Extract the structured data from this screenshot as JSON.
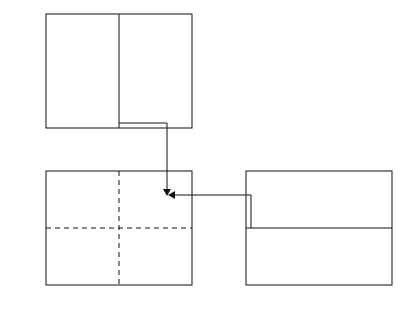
{
  "chart_data": [
    {
      "type": "line",
      "panel": "top-left",
      "title": "",
      "xlabel": "x(t)ωn/Vo",
      "ylabel": "ωnt",
      "xlim": [
        -1,
        1
      ],
      "ylim": [
        0,
        20
      ],
      "xticks": [
        "-1",
        "-0.5",
        "0",
        "0.5",
        "1"
      ],
      "yticks": [
        "0",
        "5",
        "10",
        "15",
        "20"
      ],
      "annotation": "t1",
      "t1": 0.8,
      "series": [
        {
          "name": "x(t) vs ωnt",
          "model": "damped free vibration, zeta=0.1",
          "points": [
            [
              0,
              0
            ],
            [
              0.5,
              1
            ],
            [
              0.76,
              2
            ],
            [
              0.86,
              1.5
            ],
            [
              0.39,
              2.8
            ],
            [
              0,
              3.16
            ],
            [
              -0.46,
              4
            ],
            [
              -0.6,
              4.62
            ],
            [
              -0.33,
              5.5
            ],
            [
              0,
              6.3
            ],
            [
              0.39,
              7.2
            ],
            [
              0.45,
              7.76
            ],
            [
              0.2,
              8.7
            ],
            [
              0,
              9.45
            ],
            [
              -0.27,
              10.4
            ],
            [
              -0.33,
              10.9
            ],
            [
              -0.1,
              12
            ],
            [
              0,
              12.6
            ],
            [
              0.2,
              13.6
            ],
            [
              0.24,
              14.0
            ],
            [
              0,
              15.75
            ],
            [
              -0.17,
              17.2
            ],
            [
              0,
              18.9
            ],
            [
              0.1,
              20
            ]
          ]
        }
      ]
    },
    {
      "type": "line",
      "panel": "bottom-left",
      "title": "",
      "xlabel": "x(t)ωn/Vo",
      "ylabel": "v(t)/Vo",
      "xlim": [
        -1,
        1
      ],
      "ylim": [
        -1,
        1
      ],
      "xticks": [
        "-1",
        "-0.5",
        "0",
        "0.5",
        "1"
      ],
      "yticks": [
        "-1",
        "-0.5",
        "0",
        "0.5",
        "1"
      ],
      "annotation": "(x(0),v(0))",
      "grid": "dashed axes at 0",
      "series": [
        {
          "name": "phase-plane spiral",
          "start": [
            0,
            1
          ],
          "end": [
            0,
            0
          ]
        }
      ]
    },
    {
      "type": "line",
      "panel": "bottom-right",
      "title": "",
      "xlabel": "ωnt",
      "ylabel": "v(t)/Vo",
      "xlim": [
        0,
        20
      ],
      "ylim": [
        -1,
        1
      ],
      "xticks": [
        "0",
        "5",
        "10",
        "15",
        "20"
      ],
      "yticks": [
        "-1",
        "-0.5",
        "0",
        "0.5",
        "1"
      ],
      "annotation": "t1",
      "series": [
        {
          "name": "v(t)",
          "points": [
            [
              0,
              1
            ],
            [
              1.47,
              0
            ],
            [
              2.99,
              -0.74
            ],
            [
              4.6,
              0
            ],
            [
              6.1,
              0.53
            ],
            [
              7.75,
              0
            ],
            [
              9.2,
              -0.38
            ],
            [
              10.9,
              0
            ],
            [
              12.4,
              0.28
            ],
            [
              14.1,
              0
            ],
            [
              15.5,
              -0.2
            ],
            [
              17.2,
              0
            ],
            [
              18.8,
              0.15
            ],
            [
              20,
              0.07
            ]
          ]
        }
      ]
    }
  ],
  "params": {
    "zeta": 0.1,
    "t1": 0.8
  },
  "labels": {
    "top_xlabel_main": "x(t)ω",
    "top_xlabel_sub": "n",
    "top_xlabel_tail": "/V",
    "top_xlabel_sub2": "o",
    "top_ylabel_main": "ω",
    "top_ylabel_sub": "n",
    "top_ylabel_tail": "t",
    "bl_ylabel_main": "v(t)/V",
    "bl_ylabel_sub": "o",
    "br_ylabel_main": "v(t)/V",
    "br_ylabel_sub": "o",
    "br_xlabel_main": "ω",
    "br_xlabel_sub": "n",
    "br_xlabel_tail": "t",
    "t1_main": "t",
    "t1_sub": "1",
    "initial_point": "(x(0),v(0))"
  },
  "ticks": {
    "sym": [
      "−1",
      "−0.5",
      "0",
      "0.5",
      "1"
    ],
    "time": [
      "0",
      "5",
      "10",
      "15",
      "20"
    ]
  }
}
